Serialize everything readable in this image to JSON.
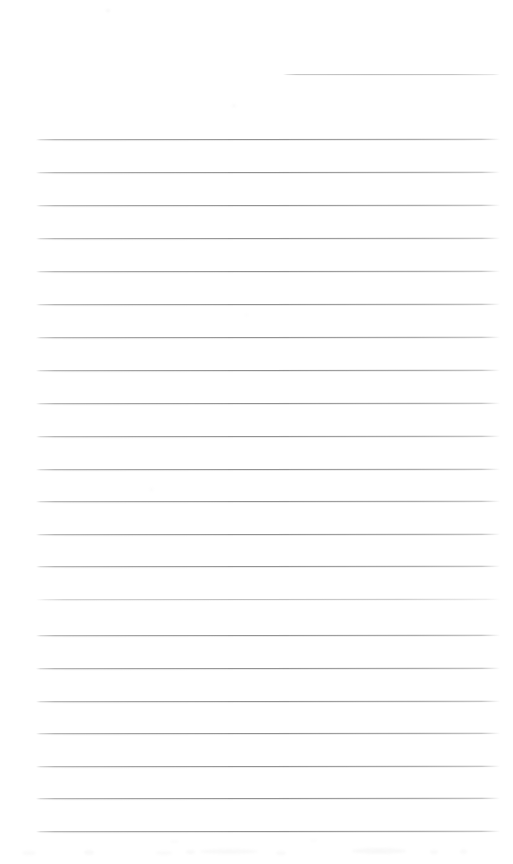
{
  "page": {
    "kind": "scanned-ruled-notebook-page",
    "width_px": 513,
    "height_px": 864,
    "background_color": "#ffffff",
    "rule_color": "#a0a0a0",
    "rule_color_faint": "#b8b8b8",
    "content_text": "",
    "handwriting_text": "",
    "typed_text": "",
    "notes_label": "blank ruled page — no written or printed text present"
  },
  "geometry": {
    "margin_left_px": 35,
    "margin_right_px": 500,
    "first_partial_rule_left_px": 283,
    "rule_spacing_px": 32.6,
    "rule_thickness_px": 1,
    "first_full_rule_y_px": 139,
    "last_full_rule_y_px": 830
  },
  "rules": [
    {
      "id": "rule-partial-1",
      "y": 74,
      "x1": 283,
      "x2": 500,
      "weight": "faint",
      "full_width": false
    },
    {
      "id": "rule-1",
      "y": 138.5,
      "x1": 36,
      "x2": 500,
      "weight": "strong",
      "full_width": true
    },
    {
      "id": "rule-2",
      "y": 171.5,
      "x1": 36,
      "x2": 500,
      "weight": "strong",
      "full_width": true
    },
    {
      "id": "rule-3",
      "y": 205,
      "x1": 36,
      "x2": 500,
      "weight": "strong",
      "full_width": true
    },
    {
      "id": "rule-4",
      "y": 238,
      "x1": 36,
      "x2": 500,
      "weight": "strong",
      "full_width": true
    },
    {
      "id": "rule-5",
      "y": 271,
      "x1": 36,
      "x2": 500,
      "weight": "strong",
      "full_width": true
    },
    {
      "id": "rule-6",
      "y": 304,
      "x1": 36,
      "x2": 500,
      "weight": "strong",
      "full_width": true
    },
    {
      "id": "rule-7",
      "y": 337,
      "x1": 36,
      "x2": 500,
      "weight": "strong",
      "full_width": true
    },
    {
      "id": "rule-8",
      "y": 370,
      "x1": 36,
      "x2": 500,
      "weight": "strong",
      "full_width": true
    },
    {
      "id": "rule-9",
      "y": 403,
      "x1": 36,
      "x2": 500,
      "weight": "strong",
      "full_width": true
    },
    {
      "id": "rule-10",
      "y": 436,
      "x1": 36,
      "x2": 500,
      "weight": "strong",
      "full_width": true
    },
    {
      "id": "rule-11",
      "y": 468.5,
      "x1": 36,
      "x2": 500,
      "weight": "strong",
      "full_width": true
    },
    {
      "id": "rule-12",
      "y": 501,
      "x1": 36,
      "x2": 500,
      "weight": "strong",
      "full_width": true
    },
    {
      "id": "rule-13",
      "y": 533.5,
      "x1": 36,
      "x2": 500,
      "weight": "strong",
      "full_width": true
    },
    {
      "id": "rule-14",
      "y": 566,
      "x1": 36,
      "x2": 500,
      "weight": "strong",
      "full_width": true
    },
    {
      "id": "rule-15",
      "y": 598.5,
      "x1": 36,
      "x2": 500,
      "weight": "faint",
      "full_width": true
    },
    {
      "id": "rule-16",
      "y": 635,
      "x1": 36,
      "x2": 500,
      "weight": "strong",
      "full_width": true
    },
    {
      "id": "rule-17",
      "y": 668,
      "x1": 36,
      "x2": 500,
      "weight": "strong",
      "full_width": true
    },
    {
      "id": "rule-18",
      "y": 700.5,
      "x1": 36,
      "x2": 500,
      "weight": "strong",
      "full_width": true
    },
    {
      "id": "rule-19",
      "y": 733,
      "x1": 36,
      "x2": 500,
      "weight": "strong",
      "full_width": true
    },
    {
      "id": "rule-20",
      "y": 765.5,
      "x1": 36,
      "x2": 500,
      "weight": "strong",
      "full_width": true
    },
    {
      "id": "rule-21",
      "y": 798,
      "x1": 36,
      "x2": 500,
      "weight": "strong",
      "full_width": true
    },
    {
      "id": "rule-22",
      "y": 830.5,
      "x1": 36,
      "x2": 500,
      "weight": "strong",
      "full_width": true
    }
  ],
  "artifacts": {
    "specks": [
      {
        "x": 106,
        "y": 9,
        "w": 4,
        "h": 3,
        "opacity": 0.35
      },
      {
        "x": 232,
        "y": 104,
        "w": 4,
        "h": 3,
        "opacity": 0.28
      },
      {
        "x": 150,
        "y": 488,
        "w": 3,
        "h": 3,
        "opacity": 0.25
      },
      {
        "x": 245,
        "y": 314,
        "w": 3,
        "h": 2,
        "opacity": 0.22
      }
    ],
    "bottom_smudges": [
      {
        "x": 22,
        "y": 17,
        "w": 14,
        "h": 4,
        "opacity": 0.22
      },
      {
        "x": 84,
        "y": 16,
        "w": 10,
        "h": 5,
        "opacity": 0.26
      },
      {
        "x": 156,
        "y": 17,
        "w": 16,
        "h": 4,
        "opacity": 0.2
      },
      {
        "x": 186,
        "y": 16,
        "w": 9,
        "h": 4,
        "opacity": 0.28
      },
      {
        "x": 200,
        "y": 15,
        "w": 58,
        "h": 5,
        "opacity": 0.24
      },
      {
        "x": 276,
        "y": 17,
        "w": 10,
        "h": 4,
        "opacity": 0.22
      },
      {
        "x": 352,
        "y": 14,
        "w": 54,
        "h": 6,
        "opacity": 0.26
      },
      {
        "x": 430,
        "y": 16,
        "w": 8,
        "h": 4,
        "opacity": 0.24
      },
      {
        "x": 460,
        "y": 15,
        "w": 7,
        "h": 5,
        "opacity": 0.22
      },
      {
        "x": 170,
        "y": 6,
        "w": 9,
        "h": 3,
        "opacity": 0.14
      },
      {
        "x": 310,
        "y": 5,
        "w": 7,
        "h": 3,
        "opacity": 0.12
      }
    ]
  }
}
